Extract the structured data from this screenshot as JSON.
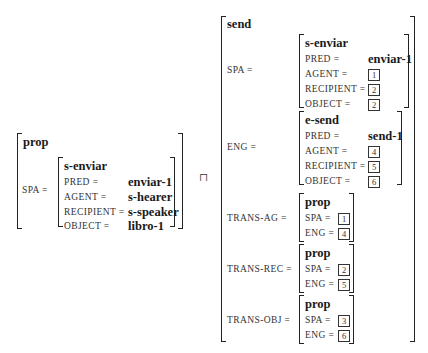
{
  "left": {
    "type": "prop",
    "feature": "SPA =",
    "inner": {
      "type": "s-enviar",
      "rows": [
        {
          "label": "PRED =",
          "value": "enviar-1"
        },
        {
          "label": "AGENT =",
          "value": "s-hearer"
        },
        {
          "label": "RECIPIENT =",
          "value": "s-speaker"
        },
        {
          "label": "OBJECT =",
          "value": "libro-1"
        }
      ]
    }
  },
  "operator": "⊓",
  "right": {
    "type": "send",
    "spa": {
      "label": "SPA =",
      "type": "s-enviar",
      "pred_label": "PRED =",
      "pred_value": "enviar-1",
      "agent_label": "AGENT =",
      "agent_tag": "1",
      "recipient_label": "RECIPIENT =",
      "recipient_tag": "2",
      "object_label": "OBJECT =",
      "object_tag": "2"
    },
    "eng": {
      "label": "ENG =",
      "type": "e-send",
      "pred_label": "PRED =",
      "pred_value": "send-1",
      "agent_label": "AGENT =",
      "agent_tag": "4",
      "recipient_label": "RECIPIENT =",
      "recipient_tag": "5",
      "object_label": "OBJECT =",
      "object_tag": "6"
    },
    "trans": [
      {
        "label": "TRANS-AG =",
        "type": "prop",
        "spa_label": "SPA =",
        "spa_tag": "1",
        "eng_label": "ENG =",
        "eng_tag": "4"
      },
      {
        "label": "TRANS-REC =",
        "type": "prop",
        "spa_label": "SPA =",
        "spa_tag": "2",
        "eng_label": "ENG =",
        "eng_tag": "5"
      },
      {
        "label": "TRANS-OBJ =",
        "type": "prop",
        "spa_label": "SPA =",
        "spa_tag": "3",
        "eng_label": "ENG =",
        "eng_tag": "6"
      }
    ]
  }
}
